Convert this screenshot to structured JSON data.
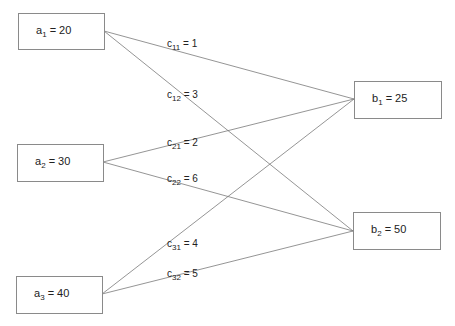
{
  "diagram": {
    "type": "transportation-network",
    "sources": [
      {
        "id": "a1",
        "symbol": "a",
        "index": "1",
        "rest": " = 20",
        "value": 20
      },
      {
        "id": "a2",
        "symbol": "a",
        "index": "2",
        "rest": " = 30",
        "value": 30
      },
      {
        "id": "a3",
        "symbol": "a",
        "index": "3",
        "rest": " = 40",
        "value": 40
      }
    ],
    "destinations": [
      {
        "id": "b1",
        "symbol": "b",
        "index": "1",
        "rest": " = 25",
        "value": 25
      },
      {
        "id": "b2",
        "symbol": "b",
        "index": "2",
        "rest": " = 50",
        "value": 50
      }
    ],
    "edges": [
      {
        "from": "a1",
        "to": "b1",
        "symbol": "c",
        "index": "11",
        "rest": " = 1",
        "cost": 1
      },
      {
        "from": "a1",
        "to": "b2",
        "symbol": "c",
        "index": "12",
        "rest": " = 3",
        "cost": 3
      },
      {
        "from": "a2",
        "to": "b1",
        "symbol": "c",
        "index": "21",
        "rest": " = 2",
        "cost": 2
      },
      {
        "from": "a2",
        "to": "b2",
        "symbol": "c",
        "index": "22",
        "rest": " = 6",
        "cost": 6
      },
      {
        "from": "a3",
        "to": "b1",
        "symbol": "c",
        "index": "31",
        "rest": " = 4",
        "cost": 4
      },
      {
        "from": "a3",
        "to": "b2",
        "symbol": "c",
        "index": "32",
        "rest": " = 5",
        "cost": 5
      }
    ],
    "colors": {
      "line": "#7a7a7a",
      "border": "#8a8a8a",
      "text": "#222222"
    }
  }
}
